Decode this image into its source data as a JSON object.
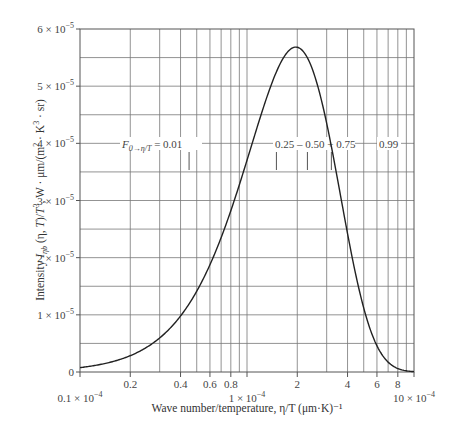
{
  "chart_data": {
    "type": "line",
    "title": "",
    "xlabel": "Wave number/temperature, η/T (μm·K)⁻¹",
    "ylabel": "Intensity I_ηb (η, T)/T³, W·μm/(m²·K³·sr)",
    "xscale": "log",
    "xlim": [
      1e-05,
      0.001
    ],
    "ylim": [
      0,
      6e-05
    ],
    "grid": true,
    "legend": null,
    "x_tick_labels": [
      {
        "x": 1e-05,
        "label": "0.1 × 10⁻⁴",
        "row": 2
      },
      {
        "x": 2e-05,
        "label": "0.2",
        "row": 1
      },
      {
        "x": 4e-05,
        "label": "0.4",
        "row": 1
      },
      {
        "x": 6e-05,
        "label": "0.6",
        "row": 1
      },
      {
        "x": 8e-05,
        "label": "0.8",
        "row": 1
      },
      {
        "x": 0.0001,
        "label": "1 × 10⁻⁴",
        "row": 2
      },
      {
        "x": 0.0002,
        "label": "2",
        "row": 1
      },
      {
        "x": 0.0004,
        "label": "4",
        "row": 1
      },
      {
        "x": 0.0006,
        "label": "6",
        "row": 1
      },
      {
        "x": 0.0008,
        "label": "8",
        "row": 1
      },
      {
        "x": 0.001,
        "label": "10 × 10⁻⁴",
        "row": 2
      }
    ],
    "y_tick_labels": [
      {
        "y": 0,
        "label": "0"
      },
      {
        "y": 1e-05,
        "label": "1 × 10⁻⁵"
      },
      {
        "y": 2e-05,
        "label": "2 × 10⁻⁵"
      },
      {
        "y": 3e-05,
        "label": "3 × 10⁻⁵"
      },
      {
        "y": 4e-05,
        "label": "4 × 10⁻⁵"
      },
      {
        "y": 5e-05,
        "label": "5 × 10⁻⁵"
      },
      {
        "y": 6e-05,
        "label": "6 × 10⁻⁵"
      }
    ],
    "series": [
      {
        "name": "Blackbody spectral intensity",
        "x": [
          1e-05,
          2e-05,
          3e-05,
          4e-05,
          5e-05,
          6e-05,
          7e-05,
          8e-05,
          9e-05,
          0.0001,
          0.00012,
          0.00014,
          0.00016,
          0.00018,
          0.0002,
          0.00022,
          0.00025,
          0.0003,
          0.00035,
          0.0004,
          0.0005,
          0.0006,
          0.0007,
          0.0008,
          0.0009,
          0.001
        ],
        "y": [
          7.7e-07,
          2.86e-06,
          5.96e-06,
          9.8e-06,
          1.413e-05,
          1.876e-05,
          2.351e-05,
          2.821e-05,
          3.276e-05,
          3.703e-05,
          4.453e-05,
          5.031e-05,
          5.423e-05,
          5.635e-05,
          5.681e-05,
          5.587e-05,
          5.244e-05,
          4.35e-05,
          3.342e-05,
          2.421e-05,
          1.119e-05,
          4.58e-06,
          1.73e-06,
          6.1e-07,
          2.1e-07,
          7e-08
        ]
      }
    ],
    "annotations": [
      {
        "text_main": "F",
        "text_sub": "0→η/T",
        "text_tail": " = 0.01",
        "marker_x": 4.5e-05
      },
      {
        "text": "0.25",
        "marker_x": 0.00015
      },
      {
        "text": "0.50",
        "marker_x": 0.00023
      },
      {
        "text": "0.75",
        "marker_x": 0.00032
      },
      {
        "text": "0.99",
        "marker_x": null
      }
    ],
    "annotation_separators": [
      "–",
      "–",
      "+"
    ]
  }
}
